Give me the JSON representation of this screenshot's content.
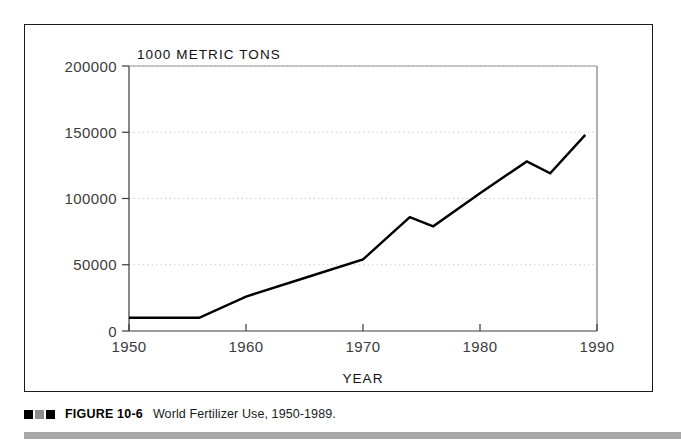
{
  "figure": {
    "caption_marker": [
      "dark",
      "mid",
      "dark"
    ],
    "figure_number": "FIGURE 10-6",
    "caption": "World Fertilizer Use, 1950-1989."
  },
  "chart_data": {
    "type": "line",
    "title": "",
    "unit_label": "1000 METRIC TONS",
    "xlabel": "YEAR",
    "ylabel": "",
    "xlim": [
      1950,
      1990
    ],
    "ylim": [
      0,
      200000
    ],
    "xticks": [
      "1950",
      "1960",
      "1970",
      "1980",
      "1990"
    ],
    "xtick_values": [
      1950,
      1960,
      1970,
      1980,
      1990
    ],
    "yticks": [
      "0",
      "50000",
      "100000",
      "150000",
      "200000"
    ],
    "ytick_values": [
      0,
      50000,
      100000,
      150000,
      200000
    ],
    "grid": "horizontal-dotted",
    "legend": "none",
    "line_color": "#000000",
    "series": [
      {
        "name": "World Fertilizer Use",
        "x": [
          1950,
          1956,
          1960,
          1965,
          1970,
          1974,
          1976,
          1980,
          1984,
          1986,
          1989
        ],
        "values": [
          10000,
          10000,
          26000,
          40000,
          54000,
          86000,
          79000,
          104000,
          128000,
          119000,
          148000
        ]
      }
    ]
  }
}
